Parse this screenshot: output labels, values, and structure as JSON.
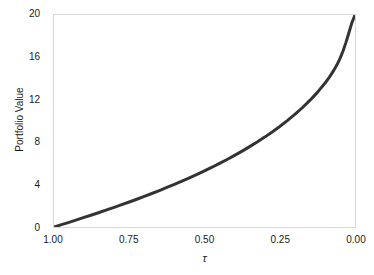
{
  "chart_data": {
    "type": "line",
    "title": "",
    "xlabel": "τ",
    "ylabel": "Portfolio Value",
    "xlim": [
      1.0,
      0.0
    ],
    "ylim": [
      0,
      20
    ],
    "x_reversed": true,
    "grid": false,
    "legend": null,
    "xticks": [
      "1.00",
      "0.75",
      "0.50",
      "0.25",
      "0.00"
    ],
    "xtick_values": [
      1.0,
      0.75,
      0.5,
      0.25,
      0.0
    ],
    "yticks": [
      "0",
      "4",
      "8",
      "12",
      "16",
      "20"
    ],
    "ytick_values": [
      0,
      4,
      8,
      12,
      16,
      20
    ],
    "series": [
      {
        "name": "Portfolio Value",
        "color": "#333333",
        "linewidth": 3,
        "x": [
          1.0,
          0.975,
          0.95,
          0.925,
          0.9,
          0.875,
          0.85,
          0.825,
          0.8,
          0.775,
          0.75,
          0.725,
          0.7,
          0.675,
          0.65,
          0.625,
          0.6,
          0.575,
          0.55,
          0.525,
          0.5,
          0.475,
          0.45,
          0.425,
          0.4,
          0.375,
          0.35,
          0.325,
          0.3,
          0.275,
          0.25,
          0.225,
          0.2,
          0.175,
          0.15,
          0.125,
          0.1,
          0.085,
          0.07,
          0.06,
          0.05,
          0.04,
          0.03,
          0.02,
          0.01,
          0.005,
          0.0
        ],
        "y": [
          0.0,
          0.22,
          0.44,
          0.67,
          0.9,
          1.13,
          1.37,
          1.61,
          1.86,
          2.11,
          2.36,
          2.62,
          2.89,
          3.16,
          3.44,
          3.73,
          4.02,
          4.33,
          4.64,
          4.96,
          5.3,
          5.64,
          6.0,
          6.37,
          6.76,
          7.16,
          7.58,
          8.02,
          8.48,
          8.97,
          9.48,
          10.03,
          10.62,
          11.25,
          11.94,
          12.7,
          13.56,
          14.14,
          14.8,
          15.3,
          15.88,
          16.58,
          17.42,
          18.35,
          19.3,
          19.65,
          20.0
        ]
      }
    ],
    "annotations": []
  },
  "figure": {
    "background_color": "#ffffff",
    "frame_color": "#d8d8d8",
    "text_color": "#1a1a1a"
  }
}
